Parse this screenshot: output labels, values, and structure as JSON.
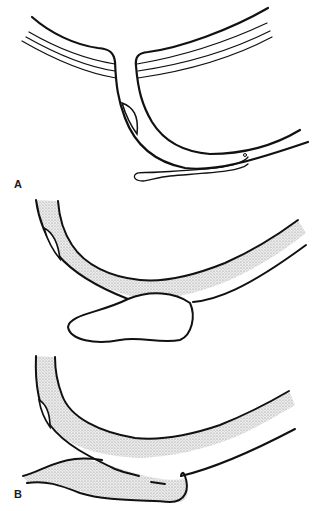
{
  "figure": {
    "panels": [
      {
        "label": "A",
        "description": "Vessel branch with sac at junction, thin tube running along lower wall with bulbous tip"
      },
      {
        "label": "B",
        "description": "Two stippled vessel views: curved vessel with lobulated outpouching, and curved vessel merging with stippled sac"
      }
    ]
  },
  "colors": {
    "line": "#111111",
    "fill": "#d9d9d9",
    "background": "#ffffff"
  }
}
